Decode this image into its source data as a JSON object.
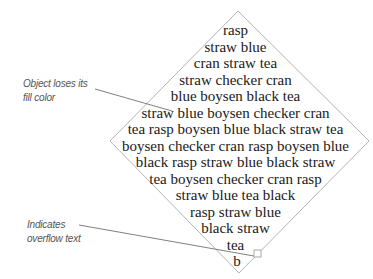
{
  "diagram": {
    "shape": "diamond",
    "text_lines": [
      "rasp",
      "straw blue",
      "cran straw tea",
      "straw checker cran",
      "blue boysen black tea",
      "straw blue boysen checker cran",
      "tea rasp boysen blue black straw tea",
      "boysen checker cran rasp boysen blue",
      "black rasp straw blue black straw",
      "tea boysen checker cran rasp",
      "straw blue tea black",
      "rasp straw blue",
      "black straw",
      "tea",
      "b"
    ],
    "callouts": [
      {
        "id": "fill-color",
        "lines": [
          "Object loses its",
          "fill color"
        ]
      },
      {
        "id": "overflow",
        "lines": [
          "Indicates",
          "overflow text"
        ]
      }
    ],
    "overflow_indicator": "overflow-box-icon"
  }
}
